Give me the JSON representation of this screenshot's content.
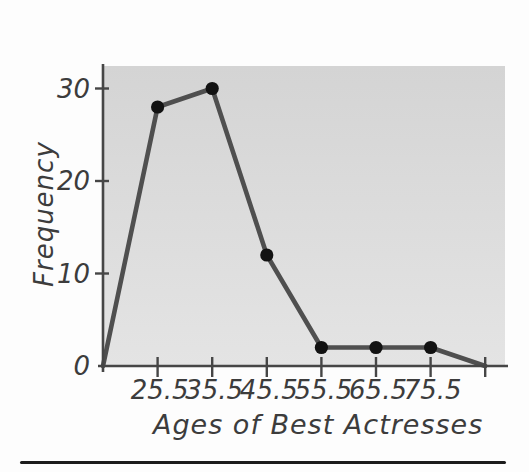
{
  "chart_data": {
    "type": "line",
    "x": [
      15.5,
      25.5,
      35.5,
      45.5,
      55.5,
      65.5,
      75.5,
      85.5
    ],
    "values": [
      0,
      28,
      30,
      12,
      2,
      2,
      2,
      0
    ],
    "marker_x": [
      25.5,
      35.5,
      45.5,
      55.5,
      65.5,
      75.5
    ],
    "title": "",
    "xlabel": "Ages of Best Actresses",
    "ylabel": "Frequency",
    "x_ticks": [
      25.5,
      35.5,
      45.5,
      55.5,
      65.5,
      75.5,
      85.5
    ],
    "x_tick_labels": [
      "25.5",
      "35.5",
      "45.5",
      "55.5",
      "65.5",
      "75.5",
      ""
    ],
    "y_ticks": [
      0,
      10,
      20,
      30
    ],
    "y_tick_labels": [
      "0",
      "10",
      "20",
      "30"
    ],
    "xlim": [
      15.5,
      89
    ],
    "ylim": [
      0,
      32.5
    ],
    "grid": false,
    "legend": null,
    "colors": {
      "line": "#4f4f4f",
      "marker": "#121212",
      "axis": "#464646",
      "text": "#3c3c3c",
      "plot_bg_top": "#d4d4d4",
      "plot_bg_bottom": "#e4e4e4"
    }
  },
  "divider": {
    "present": true,
    "color": "#1c1c1c"
  }
}
